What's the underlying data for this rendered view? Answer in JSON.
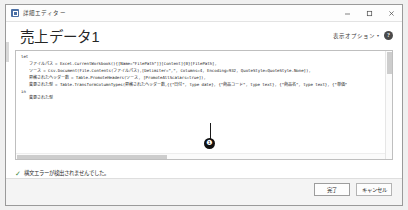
{
  "window": {
    "title": "詳細エディター",
    "app_icon": "query-editor-icon",
    "controls": [
      {
        "name": "minimize-button",
        "glyph": "minimize-icon"
      },
      {
        "name": "maximize-button",
        "glyph": "maximize-icon"
      },
      {
        "name": "close-button",
        "glyph": "close-icon"
      }
    ]
  },
  "header": {
    "query_name": "売上データ1",
    "display_options_label": "表示オプション",
    "display_options_caret": "▾",
    "help_label": "?"
  },
  "editor": {
    "lines": [
      {
        "text": "let",
        "indent": false
      },
      {
        "text": "ファイルパス = Excel.CurrentWorkbook(){[Name=\"FilePath\"]}[Content]{0}[FilePath],",
        "indent": true
      },
      {
        "text": "ソース = Csv.Document(File.Contents(ファイルパス),[Delimiter=\",\", Columns=4, Encoding=932, QuoteStyle=QuoteStyle.None]),",
        "indent": true
      },
      {
        "text": "昇格されたヘッダー数 = Table.PromoteHeaders(ソース, [PromoteAllScalars=true]),",
        "indent": true
      },
      {
        "text": "変更された型 = Table.TransformColumnTypes(昇格されたヘッダー数,{{\"日付\", type date}, {\"商品コード\", type text}, {\"商品名\", type text}, {\"単価\"",
        "indent": true
      },
      {
        "text": "in",
        "indent": false
      },
      {
        "text": "変更された型",
        "indent": true
      }
    ]
  },
  "callout": {
    "marker": "❶"
  },
  "status": {
    "check_glyph": "✓",
    "message": "構文エラーが検出されませんでした。"
  },
  "footer": {
    "done_label": "完了",
    "cancel_label": "キャンセル"
  },
  "colors": {
    "accent": "#4a6fa5",
    "status_ok": "#3c8a3c",
    "text": "#1d1d1d",
    "panel_border": "#bfbfbf"
  }
}
